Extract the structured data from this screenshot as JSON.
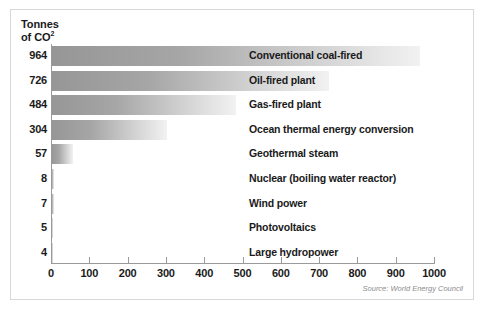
{
  "chart_data": {
    "type": "bar",
    "orientation": "horizontal",
    "title": "",
    "ylabel_block": "Tonnes\nof CO",
    "ylabel_superscript": "2",
    "xlabel": "",
    "categories": [
      "Conventional coal-fired",
      "Oil-fired plant",
      "Gas-fired plant",
      "Ocean thermal energy conversion",
      "Geothermal steam",
      "Nuclear (boiling water reactor)",
      "Wind power",
      "Photovoltaics",
      "Large hydropower"
    ],
    "values": [
      964,
      726,
      484,
      304,
      57,
      8,
      7,
      5,
      4
    ],
    "value_labels": [
      "964",
      "726",
      "484",
      "304",
      "57",
      "8",
      "7",
      "5",
      "4"
    ],
    "xlim": [
      0,
      1000
    ],
    "xticks": [
      0,
      100,
      200,
      300,
      400,
      500,
      600,
      700,
      800,
      900,
      1000
    ],
    "xtick_labels": [
      "0",
      "100",
      "200",
      "300",
      "400",
      "500",
      "600",
      "700",
      "800",
      "900",
      "1000"
    ],
    "grid": false,
    "legend": null,
    "bar_gradient_start": "#969696",
    "bar_gradient_end": "#f2f2f2",
    "axis_color": "#9a9a9a",
    "text_color": "#1a1a1a",
    "frame_color": "#d8d8d8"
  },
  "source": {
    "note": "Source: World Energy Council",
    "color": "#8c8c8c"
  }
}
